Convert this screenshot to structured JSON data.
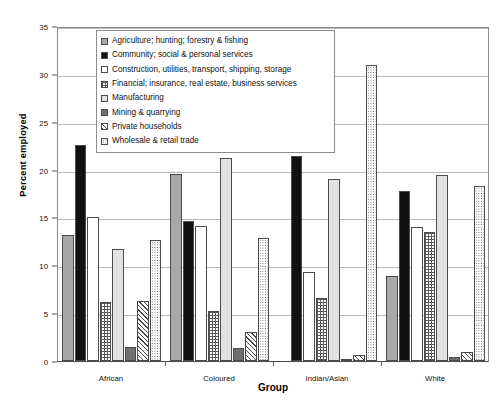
{
  "chart_data": {
    "type": "bar",
    "title": "",
    "xlabel": "Group",
    "ylabel": "Percent employed",
    "ylim": [
      0,
      35
    ],
    "yticks": [
      0,
      5,
      10,
      15,
      20,
      25,
      30,
      35
    ],
    "grid": true,
    "legend_position": "top-center-inside",
    "categories": [
      "African",
      "Coloured",
      "Indian/Asian",
      "White"
    ],
    "series": [
      {
        "name": "Agriculture; hunting; forestry & fishing",
        "pattern": "solid-gray",
        "values": [
          13.2,
          19.5,
          0.0,
          8.9
        ]
      },
      {
        "name": "Community; social & personal services",
        "pattern": "solid-black",
        "values": [
          22.6,
          14.6,
          21.4,
          17.8
        ]
      },
      {
        "name": "Construction, utilities, transport, shipping, storage",
        "pattern": "fine-dots",
        "values": [
          15.0,
          14.1,
          9.3,
          14.0
        ]
      },
      {
        "name": "Financial; insurance, real estate, business services",
        "pattern": "grid-crosshatch",
        "values": [
          6.2,
          5.2,
          6.6,
          13.5
        ]
      },
      {
        "name": "Manufacturing",
        "pattern": "light-solid",
        "values": [
          11.7,
          21.2,
          19.0,
          19.4
        ]
      },
      {
        "name": "Mining & quarrying",
        "pattern": "dark-solid",
        "values": [
          1.5,
          1.4,
          0.1,
          0.4
        ]
      },
      {
        "name": "Private households",
        "pattern": "diagonal-hatch",
        "values": [
          6.3,
          3.0,
          0.6,
          0.9
        ]
      },
      {
        "name": "Wholesale & retail trade",
        "pattern": "coarse-dots",
        "values": [
          12.6,
          12.9,
          30.9,
          18.3
        ]
      }
    ]
  },
  "axes": {
    "y_title": "Percent employed",
    "x_title": "Group",
    "y_tick_labels": [
      "0",
      "5",
      "10",
      "15",
      "20",
      "25",
      "30",
      "35"
    ],
    "x_tick_labels": [
      "African",
      "Coloured",
      "Indian/Asian",
      "White"
    ]
  },
  "legend": {
    "items": [
      "Agriculture; hunting; forestry & fishing",
      "Community; social & personal services",
      "Construction, utilities, transport, shipping, storage",
      "Financial; insurance, real estate, business services",
      "Manufacturing",
      "Mining & quarrying",
      "Private households",
      "Wholesale & retail trade"
    ]
  },
  "colors": {
    "axis": "#4a4a4a",
    "grid": "#b9b9b9",
    "text": "#111111",
    "background": "#ffffff"
  }
}
